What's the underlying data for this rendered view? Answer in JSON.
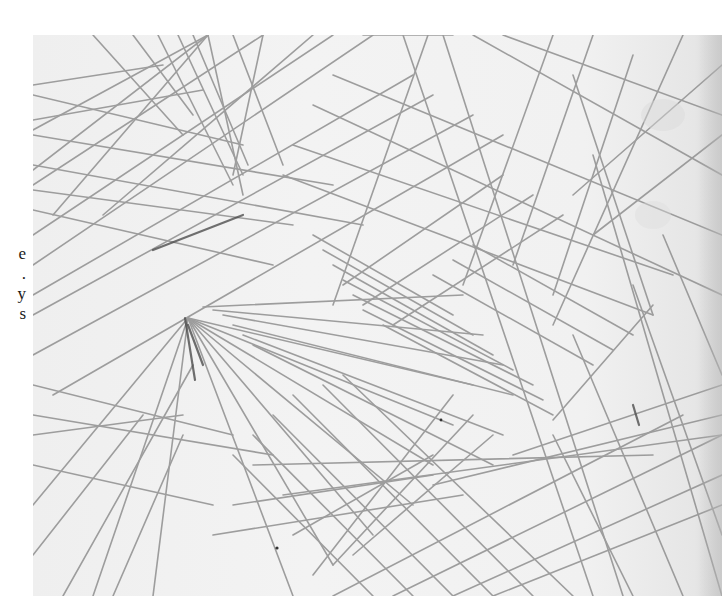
{
  "page": {
    "type": "scanned-book-page",
    "background_color": "#ffffff"
  },
  "margin_text": {
    "fragments": [
      "e",
      ".",
      "y",
      "s"
    ],
    "note": "cropped characters from adjacent text column"
  },
  "artwork": {
    "subject": "pencil line drawing of intersecting straight lines",
    "paper_color": "#f1f1f1",
    "line_color": "#8a8a8a",
    "dark_accent_color": "#4a4a4a",
    "bounds": {
      "left": 33,
      "top": 35,
      "width": 689,
      "height": 561
    }
  }
}
